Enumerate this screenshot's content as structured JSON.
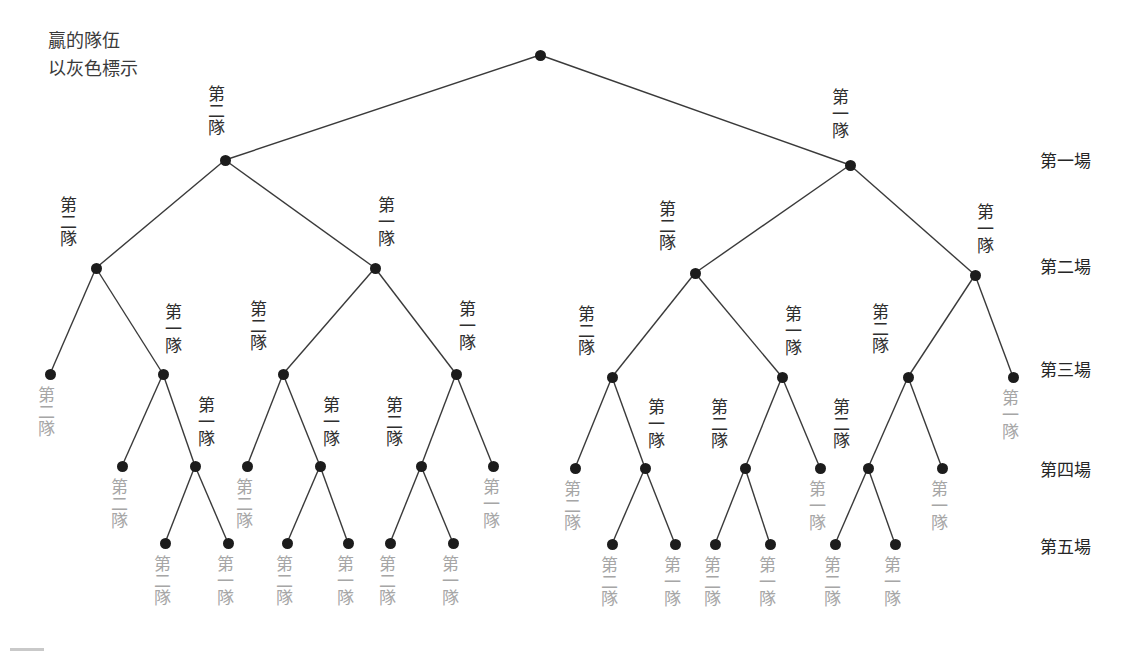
{
  "diagram": {
    "title_legend": "贏的隊伍\n以灰色標示",
    "team_one": "第一隊",
    "team_two": "第二隊",
    "colors": {
      "node": "#1c1c1c",
      "edge": "#3a3a3a",
      "label_dark": "#2e2e2e",
      "label_gray": "#a6a6a6",
      "background": "#ffffff"
    },
    "round_labels": [
      {
        "text": "第一場",
        "x": 1040,
        "y": 157
      },
      {
        "text": "第二場",
        "x": 1040,
        "y": 263
      },
      {
        "text": "第三場",
        "x": 1040,
        "y": 366
      },
      {
        "text": "第四場",
        "x": 1040,
        "y": 466
      },
      {
        "text": "第五場",
        "x": 1040,
        "y": 543
      }
    ],
    "nodes": [
      {
        "id": "r",
        "x": 540,
        "y": 55,
        "label": null,
        "tone": null
      },
      {
        "id": "L",
        "x": 225,
        "y": 160,
        "label": "第二隊",
        "tone": "dark",
        "lx": 206,
        "ly": 85
      },
      {
        "id": "R",
        "x": 850,
        "y": 165,
        "label": "第一隊",
        "tone": "dark",
        "lx": 830,
        "ly": 88
      },
      {
        "id": "LL",
        "x": 96,
        "y": 268,
        "label": "第二隊",
        "tone": "dark",
        "lx": 58,
        "ly": 196
      },
      {
        "id": "LR",
        "x": 375,
        "y": 268,
        "label": "第一隊",
        "tone": "dark",
        "lx": 376,
        "ly": 196
      },
      {
        "id": "RL",
        "x": 695,
        "y": 273,
        "label": "第二隊",
        "tone": "dark",
        "lx": 657,
        "ly": 200
      },
      {
        "id": "RR",
        "x": 975,
        "y": 275,
        "label": "第一隊",
        "tone": "dark",
        "lx": 975,
        "ly": 203
      },
      {
        "id": "LLL",
        "x": 50,
        "y": 374,
        "label": "第二隊",
        "tone": "gray",
        "lx": 36,
        "ly": 386
      },
      {
        "id": "LLR",
        "x": 163,
        "y": 374,
        "label": "第一隊",
        "tone": "dark",
        "lx": 163,
        "ly": 303
      },
      {
        "id": "LRL",
        "x": 283,
        "y": 374,
        "label": "第二隊",
        "tone": "dark",
        "lx": 248,
        "ly": 300
      },
      {
        "id": "LRR",
        "x": 456,
        "y": 374,
        "label": "第一隊",
        "tone": "dark",
        "lx": 457,
        "ly": 300
      },
      {
        "id": "RLL",
        "x": 612,
        "y": 377,
        "label": "第二隊",
        "tone": "dark",
        "lx": 576,
        "ly": 305
      },
      {
        "id": "RLR",
        "x": 782,
        "y": 377,
        "label": "第一隊",
        "tone": "dark",
        "lx": 783,
        "ly": 305
      },
      {
        "id": "RRL",
        "x": 908,
        "y": 377,
        "label": "第二隊",
        "tone": "dark",
        "lx": 870,
        "ly": 303
      },
      {
        "id": "RRR",
        "x": 1013,
        "y": 377,
        "label": "第一隊",
        "tone": "gray",
        "lx": 1000,
        "ly": 389
      },
      {
        "id": "LLRL",
        "x": 122,
        "y": 466,
        "label": "第二隊",
        "tone": "gray",
        "lx": 109,
        "ly": 478
      },
      {
        "id": "LLRR",
        "x": 195,
        "y": 466,
        "label": "第一隊",
        "tone": "dark",
        "lx": 196,
        "ly": 396
      },
      {
        "id": "LRLL",
        "x": 247,
        "y": 466,
        "label": "第二隊",
        "tone": "gray",
        "lx": 234,
        "ly": 478
      },
      {
        "id": "LRLR",
        "x": 320,
        "y": 466,
        "label": "第一隊",
        "tone": "dark",
        "lx": 321,
        "ly": 396
      },
      {
        "id": "LRRL",
        "x": 421,
        "y": 466,
        "label": "第二隊",
        "tone": "dark",
        "lx": 384,
        "ly": 396
      },
      {
        "id": "LRRR",
        "x": 493,
        "y": 466,
        "label": "第一隊",
        "tone": "gray",
        "lx": 481,
        "ly": 478
      },
      {
        "id": "RLLL",
        "x": 575,
        "y": 468,
        "label": "第二隊",
        "tone": "gray",
        "lx": 562,
        "ly": 480
      },
      {
        "id": "RLLR",
        "x": 645,
        "y": 468,
        "label": "第一隊",
        "tone": "dark",
        "lx": 646,
        "ly": 398
      },
      {
        "id": "RLRL",
        "x": 745,
        "y": 468,
        "label": "第二隊",
        "tone": "dark",
        "lx": 709,
        "ly": 398
      },
      {
        "id": "RLRR",
        "x": 820,
        "y": 468,
        "label": "第一隊",
        "tone": "gray",
        "lx": 807,
        "ly": 480
      },
      {
        "id": "RRLL",
        "x": 868,
        "y": 468,
        "label": "第二隊",
        "tone": "dark",
        "lx": 831,
        "ly": 398
      },
      {
        "id": "RRLR",
        "x": 942,
        "y": 468,
        "label": "第一隊",
        "tone": "gray",
        "lx": 929,
        "ly": 480
      },
      {
        "id": "LLRRL",
        "x": 165,
        "y": 543,
        "label": "第二隊",
        "tone": "gray",
        "lx": 152,
        "ly": 555
      },
      {
        "id": "LLRRR",
        "x": 228,
        "y": 543,
        "label": "第一隊",
        "tone": "gray",
        "lx": 215,
        "ly": 555
      },
      {
        "id": "LRLRL",
        "x": 287,
        "y": 543,
        "label": "第二隊",
        "tone": "gray",
        "lx": 274,
        "ly": 555
      },
      {
        "id": "LRLRR",
        "x": 348,
        "y": 543,
        "label": "第一隊",
        "tone": "gray",
        "lx": 335,
        "ly": 555
      },
      {
        "id": "LRRLL",
        "x": 390,
        "y": 543,
        "label": "第二隊",
        "tone": "gray",
        "lx": 377,
        "ly": 555
      },
      {
        "id": "LRRLR",
        "x": 453,
        "y": 543,
        "label": "第一隊",
        "tone": "gray",
        "lx": 440,
        "ly": 555
      },
      {
        "id": "RLLRL",
        "x": 612,
        "y": 544,
        "label": "第二隊",
        "tone": "gray",
        "lx": 599,
        "ly": 556
      },
      {
        "id": "RLLRR",
        "x": 675,
        "y": 544,
        "label": "第一隊",
        "tone": "gray",
        "lx": 662,
        "ly": 556
      },
      {
        "id": "RLRLL",
        "x": 715,
        "y": 544,
        "label": "第二隊",
        "tone": "gray",
        "lx": 702,
        "ly": 556
      },
      {
        "id": "RLRLR",
        "x": 770,
        "y": 544,
        "label": "第一隊",
        "tone": "gray",
        "lx": 757,
        "ly": 556
      },
      {
        "id": "RRLLL",
        "x": 835,
        "y": 544,
        "label": "第二隊",
        "tone": "gray",
        "lx": 822,
        "ly": 556
      },
      {
        "id": "RRLLR",
        "x": 895,
        "y": 544,
        "label": "第一隊",
        "tone": "gray",
        "lx": 882,
        "ly": 556
      }
    ],
    "edges": [
      [
        "r",
        "L"
      ],
      [
        "r",
        "R"
      ],
      [
        "L",
        "LL"
      ],
      [
        "L",
        "LR"
      ],
      [
        "R",
        "RL"
      ],
      [
        "R",
        "RR"
      ],
      [
        "LL",
        "LLL"
      ],
      [
        "LL",
        "LLR"
      ],
      [
        "LR",
        "LRL"
      ],
      [
        "LR",
        "LRR"
      ],
      [
        "RL",
        "RLL"
      ],
      [
        "RL",
        "RLR"
      ],
      [
        "RR",
        "RRL"
      ],
      [
        "RR",
        "RRR"
      ],
      [
        "LLR",
        "LLRL"
      ],
      [
        "LLR",
        "LLRR"
      ],
      [
        "LRL",
        "LRLL"
      ],
      [
        "LRL",
        "LRLR"
      ],
      [
        "LRR",
        "LRRL"
      ],
      [
        "LRR",
        "LRRR"
      ],
      [
        "RLL",
        "RLLL"
      ],
      [
        "RLL",
        "RLLR"
      ],
      [
        "RLR",
        "RLRL"
      ],
      [
        "RLR",
        "RLRR"
      ],
      [
        "RRL",
        "RRLL"
      ],
      [
        "RRL",
        "RRLR"
      ],
      [
        "LLRR",
        "LLRRL"
      ],
      [
        "LLRR",
        "LLRRR"
      ],
      [
        "LRLR",
        "LRLRL"
      ],
      [
        "LRLR",
        "LRLRR"
      ],
      [
        "LRRL",
        "LRRLL"
      ],
      [
        "LRRL",
        "LRRLR"
      ],
      [
        "RLLR",
        "RLLRL"
      ],
      [
        "RLLR",
        "RLLRR"
      ],
      [
        "RLRL",
        "RLRLL"
      ],
      [
        "RLRL",
        "RLRLR"
      ],
      [
        "RRLL",
        "RRLLL"
      ],
      [
        "RRLL",
        "RRLLR"
      ]
    ]
  }
}
